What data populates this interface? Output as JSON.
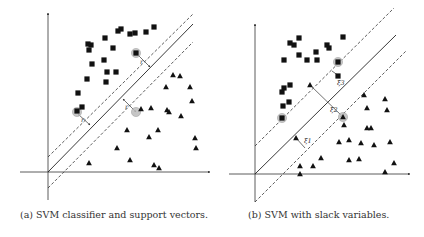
{
  "figure": {
    "subfigures": [
      {
        "id": "a",
        "caption": "(a) SVM classifier and support vectors.",
        "margin_label": "r"
      },
      {
        "id": "b",
        "caption": "(b) SVM with slack variables.",
        "slack_labels": [
          "ξ1",
          "ξ2",
          "ξ3"
        ]
      }
    ]
  },
  "chart_data": [
    {
      "type": "scatter",
      "title": "(a) SVM classifier and support vectors.",
      "xlabel": "",
      "ylabel": "",
      "grid": false,
      "legend": "none",
      "axes": {
        "origin": [
          48,
          172
        ],
        "x_end": [
          210,
          172
        ],
        "x_start": [
          20,
          172
        ],
        "y_end": [
          48,
          13
        ],
        "y_start": [
          48,
          200
        ]
      },
      "hyperplane": {
        "solid": [
          [
            48,
            172
          ],
          [
            193,
            24
          ]
        ],
        "dashed_upper": [
          [
            48,
            157
          ],
          [
            193,
            14
          ]
        ],
        "dashed_lower": [
          [
            48,
            188
          ],
          [
            193,
            42
          ]
        ]
      },
      "series": [
        {
          "name": "class-square",
          "marker": "square",
          "points": [
            [
              88,
              44
            ],
            [
              91,
              45
            ],
            [
              89,
              50
            ],
            [
              105,
              38
            ],
            [
              118,
              31
            ],
            [
              121,
              29
            ],
            [
              113,
              48
            ],
            [
              130,
              34
            ],
            [
              135,
              33
            ],
            [
              146,
              32
            ],
            [
              154,
              27
            ],
            [
              92,
              64
            ],
            [
              104,
              60
            ],
            [
              107,
              72
            ],
            [
              116,
              72
            ],
            [
              87,
              79
            ],
            [
              106,
              82
            ],
            [
              78,
              93
            ],
            [
              82,
              107
            ],
            [
              77,
              111
            ],
            [
              136,
              53
            ]
          ]
        },
        {
          "name": "class-triangle",
          "marker": "triangle",
          "points": [
            [
              173,
              75
            ],
            [
              180,
              76
            ],
            [
              166,
              87
            ],
            [
              190,
              87
            ],
            [
              192,
              101
            ],
            [
              151,
              108
            ],
            [
              167,
              110
            ],
            [
              169,
              112
            ],
            [
              181,
              116
            ],
            [
              141,
              109
            ],
            [
              127,
              130
            ],
            [
              158,
              130
            ],
            [
              149,
              137
            ],
            [
              195,
              138
            ],
            [
              196,
              148
            ],
            [
              117,
              148
            ],
            [
              89,
              163
            ],
            [
              130,
              160
            ],
            [
              154,
              165
            ],
            [
              159,
              168
            ]
          ]
        }
      ],
      "support_vectors": [
        [
          136,
          53
        ],
        [
          77,
          112
        ],
        [
          136,
          112
        ]
      ],
      "annotations": [
        {
          "text": "r",
          "arrow": [
            [
              136,
              53
            ],
            [
              150,
              67
            ]
          ],
          "label_at": [
            140,
            64
          ]
        },
        {
          "text": "r",
          "arrow": [
            [
              78,
              114
            ],
            [
              90,
              125
            ]
          ],
          "label_at": [
            81,
            122
          ]
        },
        {
          "text": "r",
          "arrow": [
            [
              136,
              112
            ],
            [
              123,
              99
            ]
          ],
          "label_at": [
            125,
            109
          ]
        }
      ]
    },
    {
      "type": "scatter",
      "title": "(b) SVM with slack variables.",
      "xlabel": "",
      "ylabel": "",
      "grid": false,
      "legend": "none",
      "axes": {
        "origin": [
          255,
          174
        ],
        "x_end": [
          410,
          174
        ],
        "x_start": [
          229,
          174
        ],
        "y_end": [
          255,
          24
        ],
        "y_start": [
          255,
          202
        ]
      },
      "hyperplane": {
        "solid": [
          [
            255,
            174
          ],
          [
            396,
            35
          ]
        ],
        "dashed_upper": [
          [
            255,
            146
          ],
          [
            394,
            8
          ]
        ],
        "dashed_lower": [
          [
            255,
            202
          ],
          [
            406,
            51
          ]
        ]
      },
      "series": [
        {
          "name": "class-square",
          "marker": "square",
          "points": [
            [
              290,
              43
            ],
            [
              294,
              45
            ],
            [
              299,
              38
            ],
            [
              284,
              60
            ],
            [
              299,
              55
            ],
            [
              307,
              60
            ],
            [
              317,
              60
            ],
            [
              316,
              52
            ],
            [
              327,
              45
            ],
            [
              329,
              48
            ],
            [
              343,
              37
            ],
            [
              290,
              85
            ],
            [
              284,
              88
            ],
            [
              282,
              92
            ],
            [
              289,
              102
            ],
            [
              283,
              106
            ],
            [
              338,
              76
            ],
            [
              338,
              62
            ],
            [
              282,
              118
            ]
          ]
        },
        {
          "name": "class-triangle",
          "marker": "triangle",
          "points": [
            [
              310,
              85
            ],
            [
              296,
              138
            ],
            [
              364,
              95
            ],
            [
              385,
              99
            ],
            [
              367,
              108
            ],
            [
              387,
              110
            ],
            [
              343,
              117
            ],
            [
              344,
              125
            ],
            [
              367,
              128
            ],
            [
              371,
              128
            ],
            [
              339,
              142
            ],
            [
              349,
              140
            ],
            [
              361,
              143
            ],
            [
              374,
              145
            ],
            [
              390,
              142
            ],
            [
              321,
              158
            ],
            [
              349,
              160
            ],
            [
              359,
              159
            ],
            [
              394,
              163
            ],
            [
              300,
              166
            ],
            [
              313,
              166
            ],
            [
              300,
              174
            ],
            [
              385,
              172
            ]
          ]
        }
      ],
      "support_vectors": [
        [
          338,
          62
        ],
        [
          282,
          118
        ],
        [
          343,
          117
        ]
      ],
      "annotations": [
        {
          "text": "ξ1",
          "line": [
            [
              296,
              138
            ],
            [
              305,
              148
            ]
          ],
          "label_at": [
            304,
            143
          ]
        },
        {
          "text": "ξ2",
          "line": [
            [
              310,
              85
            ],
            [
              343,
              117
            ]
          ],
          "label_at": [
            330,
            112
          ]
        },
        {
          "text": "ξ3",
          "line": [
            [
              332,
              71
            ],
            [
              339,
              76
            ]
          ],
          "label_at": [
            337,
            85
          ]
        }
      ]
    }
  ]
}
